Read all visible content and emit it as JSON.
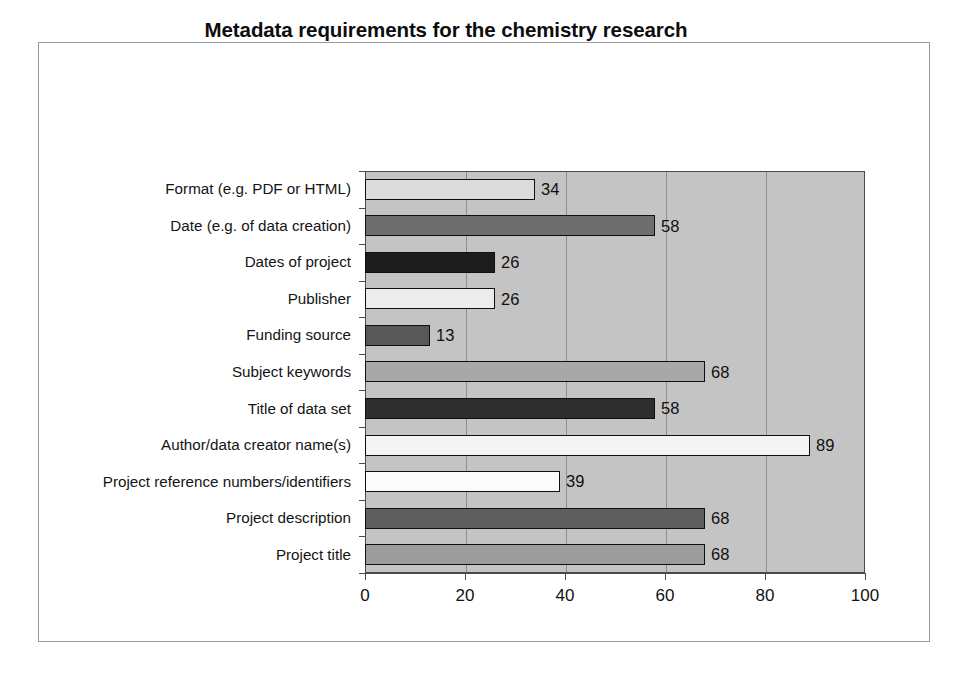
{
  "chart_data": {
    "type": "bar",
    "orientation": "horizontal",
    "title": "Metadata requirements for the chemistry research community (response by %)",
    "title_lines": [
      "Metadata requirements for the chemistry research",
      "community (response by %)"
    ],
    "xlabel": "",
    "ylabel": "",
    "xlim": [
      0,
      100
    ],
    "xticks": [
      0,
      20,
      40,
      60,
      80,
      100
    ],
    "xtick_labels": [
      "0",
      "20",
      "40",
      "60",
      "80",
      "100"
    ],
    "grid": "vertical",
    "legend": "none",
    "plot_background": "#c4c4c4",
    "figure_background": "#ffffff",
    "categories": [
      "Format (e.g. PDF or HTML)",
      "Date (e.g. of data creation)",
      "Dates of project",
      "Publisher",
      "Funding source",
      "Subject keywords",
      "Title of data set",
      "Author/data creator name(s)",
      "Project reference numbers/identifiers",
      "Project description",
      "Project title"
    ],
    "values": [
      34,
      58,
      26,
      26,
      13,
      68,
      58,
      89,
      39,
      68,
      68
    ],
    "value_labels": [
      "34",
      "58",
      "26",
      "26",
      "13",
      "68",
      "58",
      "89",
      "39",
      "68",
      "68"
    ],
    "bar_colors": [
      "#dcdcdc",
      "#6e6e6e",
      "#1d1d1d",
      "#ececec",
      "#585858",
      "#a8a8a8",
      "#2e2e2e",
      "#f4f4f4",
      "#fbfbfb",
      "#5e5e5e",
      "#9c9c9c"
    ],
    "bar_outline_color": "#0f0f0f",
    "gridline_color": "#8e8e8e",
    "axis_color": "#4a4a4a"
  }
}
